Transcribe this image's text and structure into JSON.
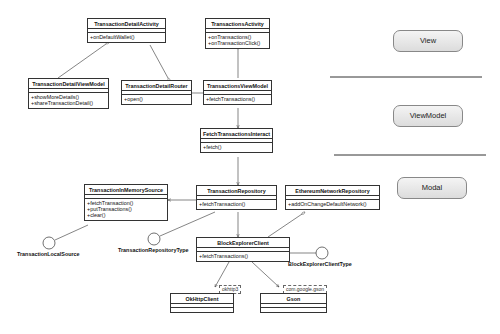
{
  "classes": {
    "transaction_detail_activity": {
      "name": "TransactionDetailActivity",
      "ops": [
        "+onDefaultWallet()"
      ]
    },
    "transactions_activity": {
      "name": "TransactionsActivity",
      "ops": [
        "+onTransactions()",
        "+onTransactionClick()"
      ]
    },
    "transaction_detail_view_model": {
      "name": "TransactionDetailViewModel",
      "ops": [
        "+showMoreDetails()",
        "+shareTransactionDetail()"
      ]
    },
    "transaction_detail_router": {
      "name": "TransactionDetailRouter",
      "ops": [
        "+open()"
      ]
    },
    "transactions_view_model": {
      "name": "TransactionsViewModel",
      "ops": [
        "+fetchTransactions()"
      ]
    },
    "fetch_transactions_interact": {
      "name": "FetchTransactionsInteract",
      "ops": [
        "+fetch()"
      ]
    },
    "transaction_in_memory_source": {
      "name": "TransactionInMemorySource",
      "ops": [
        "+fetchTransaction()",
        "+putTransactions()",
        "+clear()"
      ]
    },
    "transaction_repository": {
      "name": "TransactionRepository",
      "ops": [
        "+fetchTransaction()"
      ]
    },
    "ethereum_network_repository": {
      "name": "EthereumNetworkRepository",
      "ops": [
        "+addOnChangeDefaultNetwork()"
      ]
    },
    "block_explorer_client": {
      "name": "BlockExplorerClient",
      "ops": [
        "+fetchTransactions()"
      ]
    },
    "ok_http_client": {
      "name": "OkHttpClient",
      "package": "okhttp3"
    },
    "gson": {
      "name": "Gson",
      "package": "com.google.gson"
    }
  },
  "interfaces": {
    "transaction_local_source": "TransactionLocalSource",
    "transaction_repository_type": "TransactionRepositoryType",
    "block_explorer_client_type": "BlockExplorerClientType"
  },
  "layers": {
    "view": "View",
    "view_model": "ViewModel",
    "modal": "Modal"
  }
}
